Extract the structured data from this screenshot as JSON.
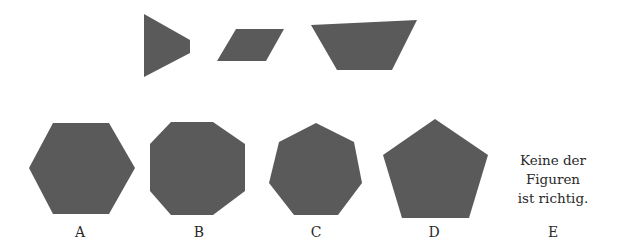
{
  "question": {
    "pieces": [
      {
        "name": "truncated-triangle",
        "points": "144,14 190,40 190,53 144,77"
      },
      {
        "name": "parallelogram",
        "points": "236,29 284,29 266,61 217,61"
      },
      {
        "name": "trapezoid",
        "points": "311,25 417,20 392,70 337,70"
      }
    ]
  },
  "options": [
    {
      "label": "A",
      "shape": "hexagon",
      "points": "53,123 109,123 135,168 109,214 53,214 29,168",
      "label_x": 60
    },
    {
      "label": "B",
      "shape": "octagon",
      "points": "171,122 213,122 245,144 245,191 213,215 171,215 150,191 150,144",
      "label_x": 179
    },
    {
      "label": "C",
      "shape": "heptagon",
      "points": "316,123 354,142 362,183 338,215 294,215 269,183 279,142",
      "label_x": 296
    },
    {
      "label": "D",
      "shape": "pentagon",
      "points": "435,119 488,155 469,218 402,218 383,155",
      "label_x": 414
    },
    {
      "label": "E",
      "text_lines": [
        "Keine der",
        "Figuren",
        "ist richtig."
      ],
      "label_x": 533
    }
  ],
  "colors": {
    "shape_fill": "#5a5a5a",
    "text": "#2a2a2a"
  }
}
